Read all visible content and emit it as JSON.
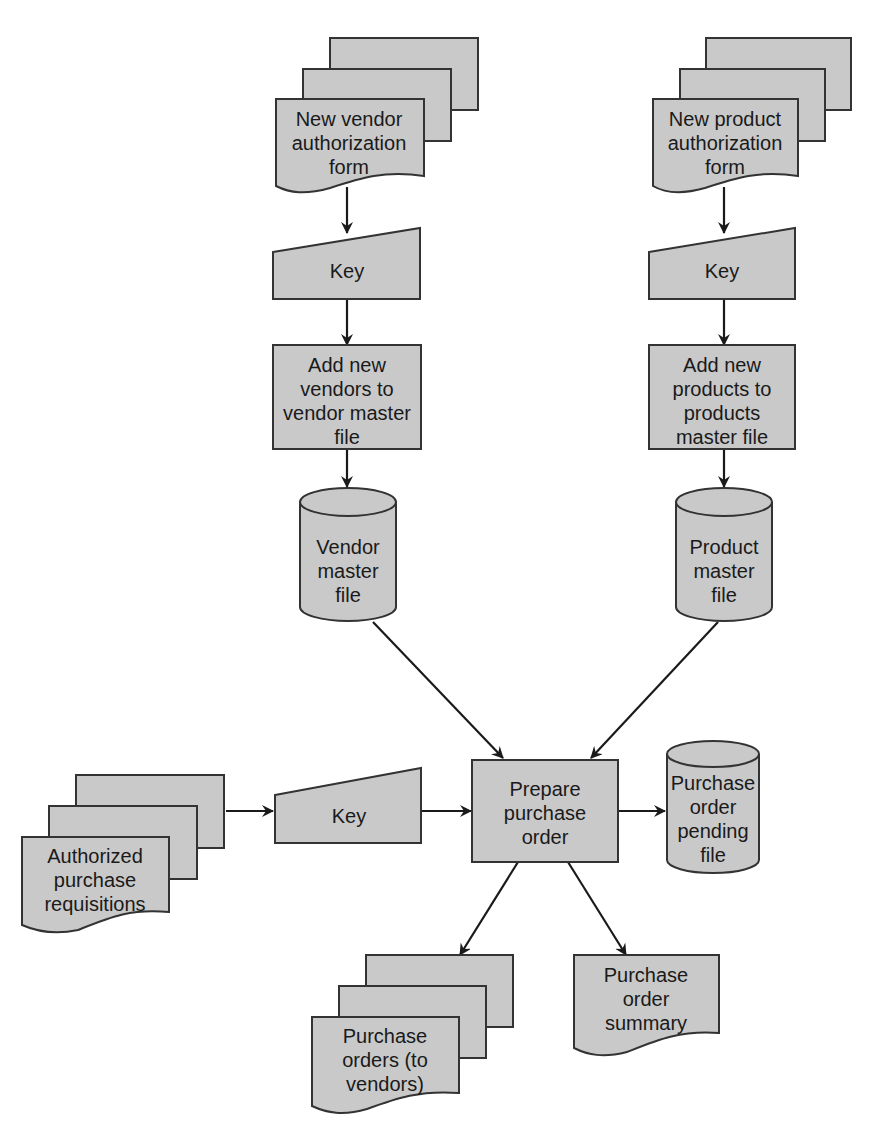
{
  "diagram": {
    "type": "system flowchart",
    "colors": {
      "fill": "#c9c9c9",
      "stroke": "#333333",
      "line": "#1a1a1a",
      "background": "#ffffff"
    },
    "nodes": {
      "vendor_form": {
        "shape": "multi-document",
        "lines": [
          "New vendor",
          "authorization",
          "form"
        ]
      },
      "vendor_key": {
        "shape": "manual-input",
        "lines": [
          "Key"
        ]
      },
      "add_vendors": {
        "shape": "process",
        "lines": [
          "Add new",
          "vendors to",
          "vendor master",
          "file"
        ]
      },
      "vendor_master": {
        "shape": "disk-storage",
        "lines": [
          "Vendor",
          "master",
          "file"
        ]
      },
      "product_form": {
        "shape": "multi-document",
        "lines": [
          "New product",
          "authorization",
          "form"
        ]
      },
      "product_key": {
        "shape": "manual-input",
        "lines": [
          "Key"
        ]
      },
      "add_products": {
        "shape": "process",
        "lines": [
          "Add new",
          "products to",
          "products",
          "master file"
        ]
      },
      "product_master": {
        "shape": "disk-storage",
        "lines": [
          "Product",
          "master",
          "file"
        ]
      },
      "requisitions": {
        "shape": "multi-document",
        "lines": [
          "Authorized",
          "purchase",
          "requisitions"
        ]
      },
      "req_key": {
        "shape": "manual-input",
        "lines": [
          "Key"
        ]
      },
      "prepare_po": {
        "shape": "process",
        "lines": [
          "Prepare",
          "purchase",
          "order"
        ]
      },
      "po_pending": {
        "shape": "disk-storage",
        "lines": [
          "Purchase",
          "order",
          "pending",
          "file"
        ]
      },
      "purchase_orders": {
        "shape": "multi-document",
        "lines": [
          "Purchase",
          "orders (to",
          "vendors)"
        ]
      },
      "po_summary": {
        "shape": "document",
        "lines": [
          "Purchase",
          "order",
          "summary"
        ]
      }
    },
    "edges": [
      [
        "vendor_form",
        "vendor_key"
      ],
      [
        "vendor_key",
        "add_vendors"
      ],
      [
        "add_vendors",
        "vendor_master"
      ],
      [
        "vendor_master",
        "prepare_po"
      ],
      [
        "product_form",
        "product_key"
      ],
      [
        "product_key",
        "add_products"
      ],
      [
        "add_products",
        "product_master"
      ],
      [
        "product_master",
        "prepare_po"
      ],
      [
        "requisitions",
        "req_key"
      ],
      [
        "req_key",
        "prepare_po"
      ],
      [
        "prepare_po",
        "po_pending"
      ],
      [
        "prepare_po",
        "purchase_orders"
      ],
      [
        "prepare_po",
        "po_summary"
      ]
    ]
  }
}
